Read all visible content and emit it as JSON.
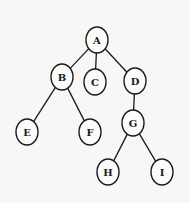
{
  "diagram": {
    "type": "tree",
    "colors": {
      "background": "#f7f7f5",
      "stroke": "#1a1a1a",
      "node_fill": "#fbfbfa"
    },
    "nodes": [
      {
        "id": "A",
        "label": "A",
        "x": 97,
        "y": 40
      },
      {
        "id": "B",
        "label": "B",
        "x": 62,
        "y": 77
      },
      {
        "id": "C",
        "label": "C",
        "x": 95,
        "y": 82
      },
      {
        "id": "D",
        "label": "D",
        "x": 135,
        "y": 81
      },
      {
        "id": "E",
        "label": "E",
        "x": 27,
        "y": 132
      },
      {
        "id": "F",
        "label": "F",
        "x": 90,
        "y": 132
      },
      {
        "id": "G",
        "label": "G",
        "x": 133,
        "y": 123
      },
      {
        "id": "H",
        "label": "H",
        "x": 108,
        "y": 172
      },
      {
        "id": "I",
        "label": "I",
        "x": 162,
        "y": 172
      }
    ],
    "edges": [
      {
        "from": "A",
        "to": "B"
      },
      {
        "from": "A",
        "to": "C"
      },
      {
        "from": "A",
        "to": "D"
      },
      {
        "from": "B",
        "to": "E"
      },
      {
        "from": "B",
        "to": "F"
      },
      {
        "from": "D",
        "to": "G"
      },
      {
        "from": "G",
        "to": "H"
      },
      {
        "from": "G",
        "to": "I"
      }
    ]
  }
}
